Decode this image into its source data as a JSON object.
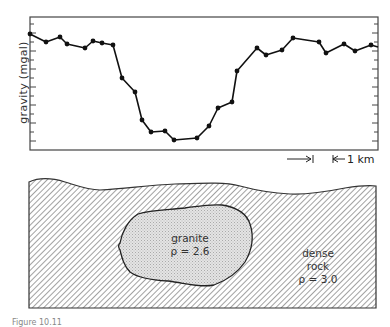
{
  "chart_data": {
    "type": "line",
    "title": "",
    "xlabel": "",
    "ylabel": "gravity (mgal)",
    "grid": false,
    "scale_bar": "1 km",
    "note": "Values are relative pixel-derived gravity readings (higher = stronger); no numeric tick labels shown",
    "x": [
      0,
      16,
      30,
      37,
      55,
      63,
      72,
      83,
      92,
      105,
      112,
      121,
      135,
      144,
      167,
      179,
      188,
      202,
      207,
      227,
      236,
      252,
      263,
      289,
      296,
      314,
      325,
      341
    ],
    "y": [
      116,
      108,
      113,
      106,
      102,
      109,
      107,
      105,
      72,
      58,
      30,
      18,
      19,
      10,
      12,
      24,
      42,
      48,
      79,
      102,
      95,
      100,
      112,
      108,
      97,
      106,
      99,
      105
    ],
    "points_px": [
      [
        30,
        34
      ],
      [
        46,
        42
      ],
      [
        60,
        37
      ],
      [
        67,
        44
      ],
      [
        85,
        48
      ],
      [
        93,
        41
      ],
      [
        102,
        43
      ],
      [
        113,
        45
      ],
      [
        122,
        78
      ],
      [
        135,
        92
      ],
      [
        142,
        120
      ],
      [
        151,
        132
      ],
      [
        165,
        131
      ],
      [
        174,
        140
      ],
      [
        197,
        138
      ],
      [
        209,
        126
      ],
      [
        218,
        108
      ],
      [
        232,
        102
      ],
      [
        237,
        71
      ],
      [
        257,
        48
      ],
      [
        266,
        55
      ],
      [
        282,
        50
      ],
      [
        293,
        38
      ],
      [
        319,
        42
      ],
      [
        326,
        53
      ],
      [
        344,
        44
      ],
      [
        355,
        51
      ],
      [
        371,
        45
      ]
    ]
  },
  "labels": {
    "y_axis": "gravity (mgal)",
    "scale": "1 km",
    "granite_name": "granite",
    "granite_density": "ρ = 2.6",
    "dense_name_1": "dense",
    "dense_name_2": "rock",
    "dense_density": "ρ = 3.0",
    "caption": "Figure 10.11"
  },
  "colors": {
    "line": "#111111",
    "hatch": "#8a8a8a",
    "granite_fill": "#d8d8d8"
  }
}
